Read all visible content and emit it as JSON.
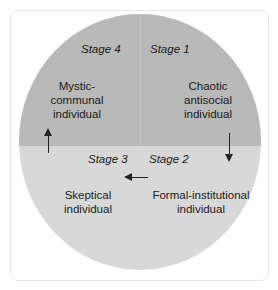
{
  "diagram": {
    "colors": {
      "top_half": "#b9b9b9",
      "bottom_half": "#d8d8d8",
      "text": "#1a1a1a"
    },
    "quadrants": [
      {
        "stage": "Stage 1",
        "label_lines": [
          "Chaotic",
          "antisocial",
          "individual"
        ]
      },
      {
        "stage": "Stage 2",
        "label_lines": [
          "Formal-institutional",
          "individual"
        ]
      },
      {
        "stage": "Stage 3",
        "label_lines": [
          "Skeptical",
          "individual"
        ]
      },
      {
        "stage": "Stage 4",
        "label_lines": [
          "Mystic-",
          "communal",
          "individual"
        ]
      }
    ],
    "arrows": [
      {
        "from": "Stage 1",
        "to": "Stage 2",
        "direction": "down"
      },
      {
        "from": "Stage 2",
        "to": "Stage 3",
        "direction": "left"
      },
      {
        "from": "Stage 3",
        "to": "Stage 4",
        "direction": "up"
      }
    ]
  }
}
